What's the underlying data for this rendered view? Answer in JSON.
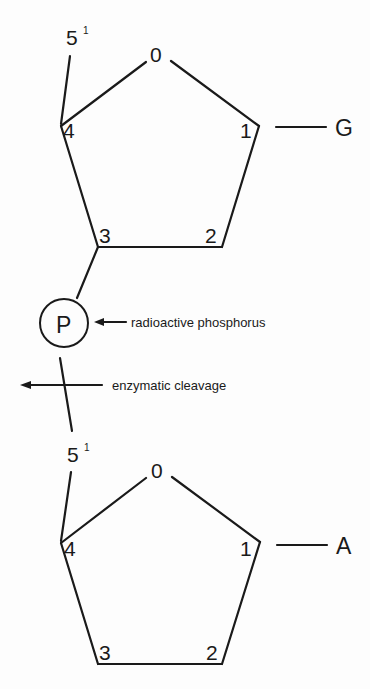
{
  "diagram": {
    "type": "dinucleotide-phosphodiester-linkage",
    "top_sugar": {
      "ring_labels": {
        "o": "0",
        "c1": "1",
        "c2": "2",
        "c3": "3",
        "c4": "4"
      },
      "c5_label": "5",
      "c5_prime": "1",
      "base": "G"
    },
    "phosphate": {
      "label": "P",
      "annotation": "radioactive phosphorus"
    },
    "cleavage": {
      "annotation": "enzymatic cleavage"
    },
    "bottom_sugar": {
      "ring_labels": {
        "o": "0",
        "c1": "1",
        "c2": "2",
        "c3": "3",
        "c4": "4"
      },
      "c5_label": "5",
      "c5_prime": "1",
      "base": "A"
    }
  },
  "colors": {
    "ink": "#1a1a1a",
    "background": "#fdfdfd"
  }
}
